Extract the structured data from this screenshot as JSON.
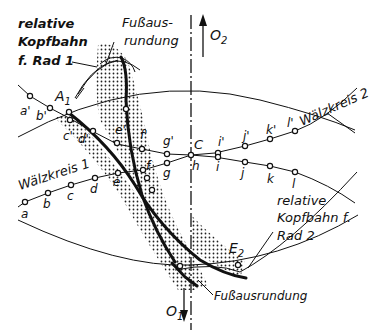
{
  "diagram": {
    "labels": {
      "relative_head_path_wheel1": [
        "relative",
        "Kopfbahn",
        "f. Rad 1"
      ],
      "root_fillet_top": [
        "Fußaus-",
        "rundung"
      ],
      "root_fillet_bottom": "Fußausrundung",
      "relative_head_path_wheel2": [
        "relative",
        "Kopfbahn f.",
        "Rad 2"
      ],
      "pitch_circle_1": "Wälzkreis 1",
      "pitch_circle_2": "Wälzkreis 2",
      "center_2": "O",
      "center_2_sub": "2",
      "center_1": "O",
      "center_1_sub": "1",
      "point_A1": "A",
      "point_A1_sub": "1",
      "point_E2": "E",
      "point_E2_sub": "2",
      "pitch_point": "C"
    },
    "points_wheel2": [
      "a'",
      "b'",
      "c'",
      "d'",
      "e'",
      "f'",
      "g'",
      "i'",
      "j'",
      "k'",
      "l'"
    ],
    "points_wheel1": [
      "a",
      "b",
      "c",
      "d",
      "e",
      "f",
      "g",
      "h",
      "i",
      "j",
      "k",
      "l"
    ]
  }
}
